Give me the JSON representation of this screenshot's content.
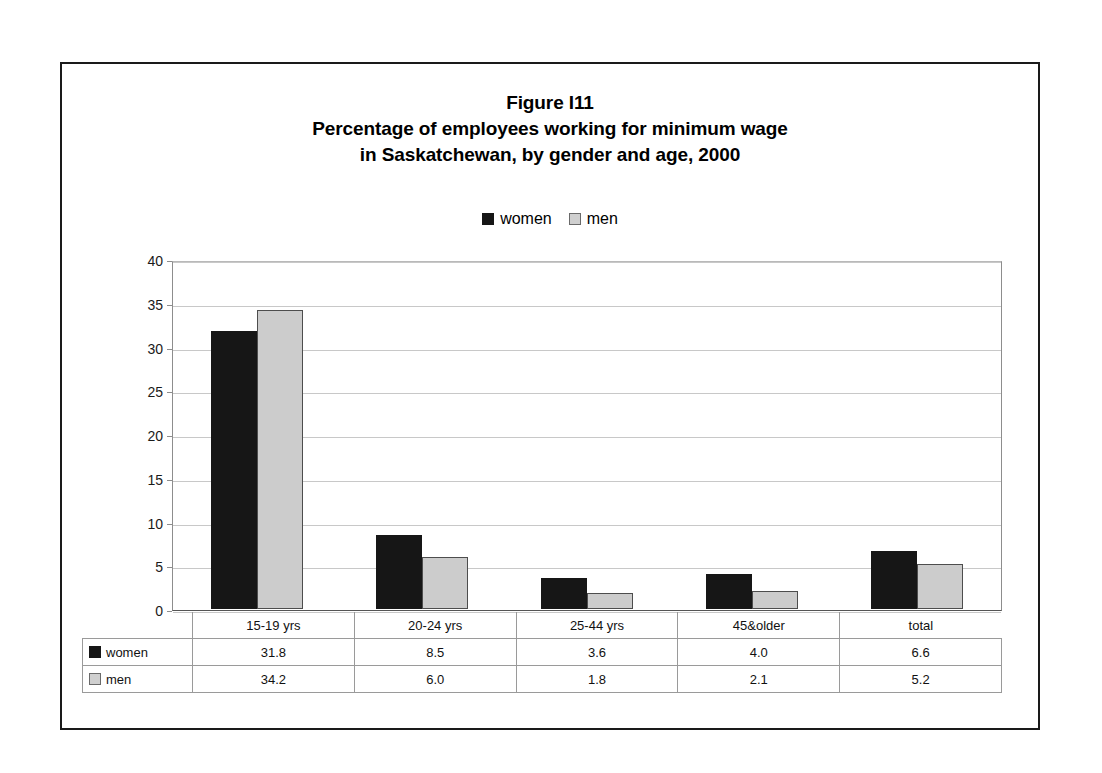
{
  "chart_data": {
    "type": "bar",
    "title": "Figure I11\nPercentage of employees working for minimum wage\nin Saskatchewan, by gender and age, 2000",
    "title_lines": [
      "Figure I11",
      "Percentage of employees working for minimum wage",
      "in Saskatchewan, by gender and age, 2000"
    ],
    "xlabel": "",
    "ylabel": "",
    "ylim": [
      0,
      40
    ],
    "ytick_labels": [
      "40",
      "35",
      "30",
      "25",
      "20",
      "15",
      "10",
      "5",
      "0"
    ],
    "ytick_values": [
      40,
      35,
      30,
      25,
      20,
      15,
      10,
      5,
      0
    ],
    "grid": true,
    "legend_position": "top-center",
    "categories": [
      "15-19 yrs",
      "20-24 yrs",
      "25-44 yrs",
      "45&older",
      "total"
    ],
    "series": [
      {
        "name": "women",
        "color": "#161616",
        "values": [
          31.8,
          8.5,
          3.6,
          4.0,
          6.6
        ],
        "value_labels": [
          "31.8",
          "8.5",
          "3.6",
          "4.0",
          "6.6"
        ]
      },
      {
        "name": "men",
        "color": "#cccccc",
        "values": [
          34.2,
          6.0,
          1.8,
          2.1,
          5.2
        ],
        "value_labels": [
          "34.2",
          "6.0",
          "1.8",
          "2.1",
          "5.2"
        ]
      }
    ],
    "data_table": {
      "show": true,
      "column_headers": [
        "15-19 yrs",
        "20-24 yrs",
        "25-44 yrs",
        "45&older",
        "total"
      ],
      "rows": [
        {
          "label": "women",
          "values": [
            "31.8",
            "8.5",
            "3.6",
            "4.0",
            "6.6"
          ]
        },
        {
          "label": "men",
          "values": [
            "34.2",
            "6.0",
            "1.8",
            "2.1",
            "5.2"
          ]
        }
      ]
    }
  },
  "legend": {
    "items": [
      {
        "label": "women",
        "swatch": "black-square-icon"
      },
      {
        "label": "men",
        "swatch": "gray-square-icon"
      }
    ]
  },
  "colors": {
    "women": "#161616",
    "men": "#cccccc",
    "frame": "#1a1a1a",
    "gridline": "#c8c8c8",
    "axis": "#555555"
  }
}
